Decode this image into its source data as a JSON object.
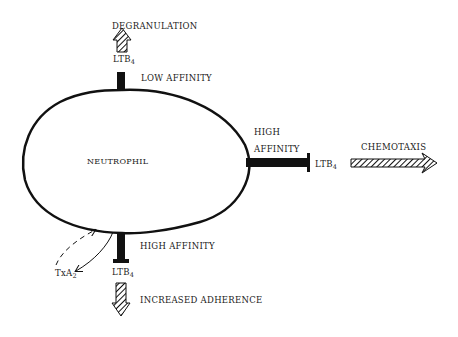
{
  "diagram": {
    "cell": {
      "label": "NEUTROPHIL"
    },
    "receptors": [
      {
        "id": "top",
        "affinity_label": "LOW AFFINITY",
        "ligand": {
          "base": "LTB",
          "sub": "4"
        },
        "response": "DEGRANULATION"
      },
      {
        "id": "right",
        "affinity_label_line1": "HIGH",
        "affinity_label_line2": "AFFINITY",
        "ligand": {
          "base": "LTB",
          "sub": "4"
        },
        "response": "CHEMOTAXIS"
      },
      {
        "id": "bottom",
        "affinity_label": "HIGH AFFINITY",
        "ligand": {
          "base": "LTB",
          "sub": "4"
        },
        "response": "INCREASED ADHERENCE"
      }
    ],
    "secondary_mediator": {
      "base": "TxA",
      "sub": "2"
    },
    "colors": {
      "stroke": "#111111",
      "background": "#ffffff",
      "text": "#1a1a1a"
    }
  }
}
